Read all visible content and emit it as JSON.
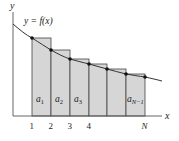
{
  "diagram": {
    "curve_label": "y = f(x)",
    "axis_labels": {
      "x": "x",
      "y": "y"
    },
    "tick_labels": [
      "1",
      "2",
      "3",
      "4",
      "N"
    ],
    "rect_labels": [
      {
        "base": "a",
        "sub": "1"
      },
      {
        "base": "a",
        "sub": "2"
      },
      {
        "base": "a",
        "sub": "3"
      },
      {
        "base": "a",
        "sub": "N−1"
      }
    ],
    "colors": {
      "fill": "#d6d6d6",
      "line": "#333333",
      "axis": "#555555"
    }
  }
}
